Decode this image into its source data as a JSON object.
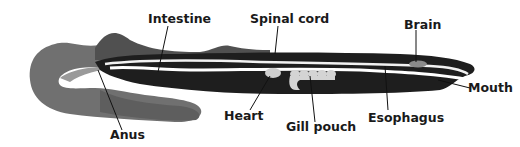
{
  "diagram": {
    "labels": [
      {
        "id": "intestine",
        "text": "Intestine"
      },
      {
        "id": "spinal_cord",
        "text": "Spinal cord"
      },
      {
        "id": "brain",
        "text": "Brain"
      },
      {
        "id": "mouth",
        "text": "Mouth"
      },
      {
        "id": "esophagus",
        "text": "Esophagus"
      },
      {
        "id": "gill_pouch",
        "text": "Gill pouch"
      },
      {
        "id": "heart",
        "text": "Heart"
      },
      {
        "id": "anus",
        "text": "Anus"
      }
    ],
    "colors": {
      "body_dark": "#1e1e1e",
      "tail_gray": "#6e6e6e",
      "tail_light": "#9a9a9a",
      "organ_light": "#d8d8d8",
      "line": "#111111"
    }
  }
}
